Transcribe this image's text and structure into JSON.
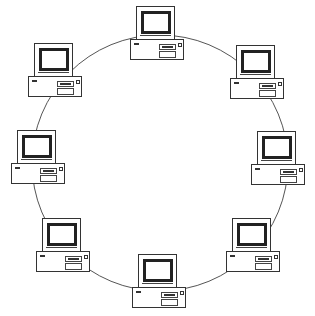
{
  "diagram": {
    "type": "ring-network-topology",
    "ring": {
      "cx": 160,
      "cy": 163,
      "r": 128,
      "stroke": "#555555"
    },
    "node_count": 8,
    "nodes": [
      {
        "id": "top",
        "label": "computer",
        "x": 130,
        "y": 6
      },
      {
        "id": "top-right",
        "label": "computer",
        "x": 230,
        "y": 45
      },
      {
        "id": "right",
        "label": "computer",
        "x": 251,
        "y": 131
      },
      {
        "id": "bottom-right",
        "label": "computer",
        "x": 226,
        "y": 218
      },
      {
        "id": "bottom",
        "label": "computer",
        "x": 132,
        "y": 254
      },
      {
        "id": "bottom-left",
        "label": "computer",
        "x": 36,
        "y": 218
      },
      {
        "id": "left",
        "label": "computer",
        "x": 11,
        "y": 130
      },
      {
        "id": "top-left",
        "label": "computer",
        "x": 28,
        "y": 43
      }
    ],
    "colors": {
      "line": "#333333",
      "background": "#ffffff"
    }
  }
}
